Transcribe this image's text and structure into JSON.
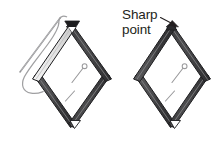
{
  "illustration": {
    "title": "Sharp point diagram",
    "description": "Two diamond-shaped frames built from dark bars; the left one is shown with a sewing needle and thread passing along its upper-left edge, the right one is labelled with a callout pointing at its top apex.",
    "background_color": "#ffffff"
  },
  "annotation": {
    "label_line1": "Sharp",
    "label_line2": "point",
    "label_color": "#231f20",
    "leader_arrow": "arrow-to-apex",
    "target": "top-apex-of-right-diamond"
  },
  "colors": {
    "bar_dark": "#4a4a4c",
    "bar_darker": "#2f2f31",
    "bar_outline": "#1a1a1a",
    "bar_highlight": "#e8e8e8",
    "bar_highlight_edge": "#bdbdbd",
    "needle": "#8c8c8e",
    "thread": "#9a9a9c",
    "pin": "#9a9a9c",
    "interior": "#ffffff"
  },
  "shapes": {
    "left_diamond": {
      "name": "diamond-frame-with-needle",
      "top_vertex_marker": "dark-arrowhead",
      "highlighted_edge": "upper-left",
      "interior_pin": true,
      "interior_dash": true,
      "bottom_vertex_notch": true
    },
    "right_diamond": {
      "name": "diamond-frame-plain",
      "top_vertex_marker": "sharp-point",
      "highlighted_edge": "none",
      "interior_pin": true,
      "interior_dash": true,
      "bottom_vertex_notch": true
    },
    "needle": {
      "name": "sewing-needle",
      "visible": true
    },
    "thread": {
      "name": "thread-loop",
      "visible": true
    }
  }
}
